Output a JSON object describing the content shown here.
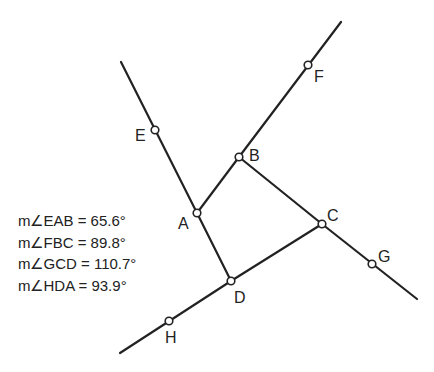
{
  "diagram": {
    "points": {
      "A": {
        "label": "A",
        "x": 197,
        "y": 213
      },
      "B": {
        "label": "B",
        "x": 239,
        "y": 157
      },
      "C": {
        "label": "C",
        "x": 322,
        "y": 224
      },
      "D": {
        "label": "D",
        "x": 231,
        "y": 281
      },
      "E": {
        "label": "E",
        "x": 155,
        "y": 130
      },
      "F": {
        "label": "F",
        "x": 308,
        "y": 65
      },
      "G": {
        "label": "G",
        "x": 372,
        "y": 264
      },
      "H": {
        "label": "H",
        "x": 169,
        "y": 321
      }
    },
    "measurements": [
      {
        "text": "m∠EAB = 65.6°"
      },
      {
        "text": "m∠FBC = 89.8°"
      },
      {
        "text": "m∠GCD = 110.7°"
      },
      {
        "text": "m∠HDA = 93.9°"
      }
    ],
    "stroke_color": "#222222"
  }
}
